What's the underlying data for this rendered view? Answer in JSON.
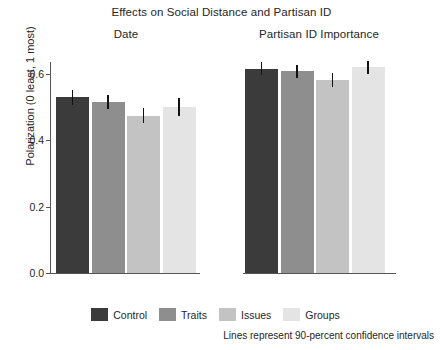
{
  "chart_data": {
    "type": "bar",
    "title": "Effects on Social Distance and Partisan ID",
    "xlabel": "",
    "ylabel": "Polarization (0 least, 1 most)",
    "ylim": [
      0.0,
      0.66
    ],
    "yticks": [
      "0.0",
      "0.2",
      "0.4",
      "0.6"
    ],
    "ytick_values": [
      0.0,
      0.2,
      0.4,
      0.6
    ],
    "grid": false,
    "legend_position": "bottom-center",
    "categories": [
      "Control",
      "Traits",
      "Issues",
      "Groups"
    ],
    "panels": [
      {
        "name": "Date",
        "values": [
          0.53,
          0.515,
          0.475,
          0.5
        ],
        "ci_low": [
          0.508,
          0.494,
          0.452,
          0.474
        ],
        "ci_high": [
          0.552,
          0.537,
          0.498,
          0.527
        ]
      },
      {
        "name": "Partisan ID Importance",
        "values": [
          0.615,
          0.608,
          0.583,
          0.62
        ],
        "ci_low": [
          0.596,
          0.589,
          0.562,
          0.6
        ],
        "ci_high": [
          0.635,
          0.628,
          0.604,
          0.641
        ]
      }
    ],
    "annotation": "Lines represent 90-percent confidence intervals",
    "colors": {
      "Control": "#3b3b3b",
      "Traits": "#8e8e8e",
      "Issues": "#c3c3c3",
      "Groups": "#e4e4e4",
      "axis": "#555555",
      "error_bar": "#111111"
    }
  },
  "legend": {
    "items": [
      {
        "label": "Control",
        "color": "#3b3b3b"
      },
      {
        "label": "Traits",
        "color": "#8e8e8e"
      },
      {
        "label": "Issues",
        "color": "#c3c3c3"
      },
      {
        "label": "Groups",
        "color": "#e4e4e4"
      }
    ]
  }
}
